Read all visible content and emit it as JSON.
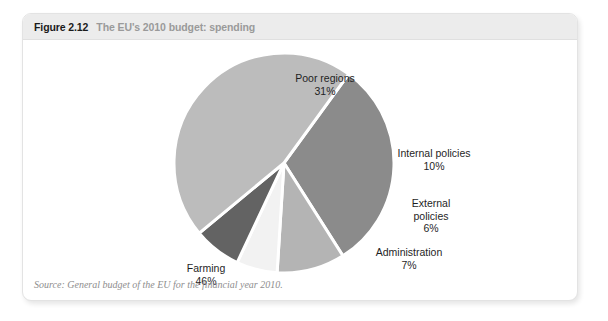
{
  "figure": {
    "number": "Figure 2.12",
    "title": "The EU's 2010 budget: spending",
    "source": "Source: General budget of the EU for the financial year 2010."
  },
  "labels": {
    "poor_regions": {
      "name": "Poor regions",
      "pct": "31%"
    },
    "internal_policies": {
      "name": "Internal policies",
      "pct": "10%"
    },
    "external_policies": {
      "name": "External",
      "name2": "policies",
      "pct": "6%"
    },
    "administration": {
      "name": "Administration",
      "pct": "7%"
    },
    "farming": {
      "name": "Farming",
      "pct": "46%"
    }
  },
  "colors": {
    "poor_regions": "#8b8b8b",
    "internal_policies": "#b4b4b4",
    "external_policies": "#f2f2f2",
    "administration": "#636363",
    "farming": "#bcbcbc",
    "separator": "#ffffff",
    "header_band": "#ececec",
    "figure_number_text": "#1b1b1b",
    "figure_title_text": "#9a9a9a",
    "source_text": "#8e8e8e"
  },
  "chart_data": {
    "type": "pie",
    "title": "The EU's 2010 budget: spending",
    "subtitle": "",
    "xlabel": "",
    "ylabel": "",
    "legend_position": "none",
    "grid": false,
    "labels_shown": "category name and percentage outside each slice",
    "categories": [
      "Poor regions",
      "Internal policies",
      "External policies",
      "Administration",
      "Farming"
    ],
    "values": [
      31,
      10,
      6,
      7,
      46
    ],
    "units": "percent of total EU budget spending",
    "total": 100,
    "start_angle_deg": -54,
    "direction": "clockwise",
    "slice_colors": [
      "#8b8b8b",
      "#b4b4b4",
      "#f2f2f2",
      "#636363",
      "#bcbcbc"
    ],
    "series": [
      {
        "name": "EU 2010 budget spending",
        "values": [
          31,
          10,
          6,
          7,
          46
        ]
      }
    ]
  }
}
